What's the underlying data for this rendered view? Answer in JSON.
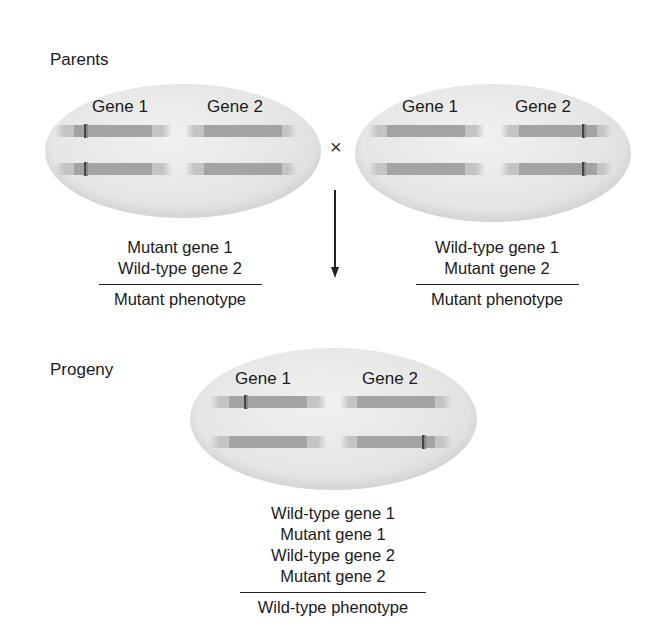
{
  "parents": {
    "section_label": "Parents",
    "cross_symbol": "×",
    "left": {
      "gene_labels": [
        "Gene 1",
        "Gene 2"
      ],
      "chromosomes": [
        {
          "gene1_mutant": true,
          "gene2_mutant": false
        },
        {
          "gene1_mutant": true,
          "gene2_mutant": false
        }
      ],
      "genotype": [
        "Mutant gene 1",
        "Wild-type gene 2"
      ],
      "phenotype": "Mutant phenotype"
    },
    "right": {
      "gene_labels": [
        "Gene 1",
        "Gene 2"
      ],
      "chromosomes": [
        {
          "gene1_mutant": false,
          "gene2_mutant": true
        },
        {
          "gene1_mutant": false,
          "gene2_mutant": true
        }
      ],
      "genotype": [
        "Wild-type gene 1",
        "Mutant gene 2"
      ],
      "phenotype": "Mutant phenotype"
    }
  },
  "progeny": {
    "section_label": "Progeny",
    "gene_labels": [
      "Gene 1",
      "Gene 2"
    ],
    "chromosomes": [
      {
        "gene1_mutant": true,
        "gene2_mutant": false
      },
      {
        "gene1_mutant": false,
        "gene2_mutant": true
      }
    ],
    "genotype": [
      "Wild-type gene 1",
      "Mutant gene 1",
      "Wild-type gene 2",
      "Mutant gene 2"
    ],
    "phenotype": "Wild-type phenotype"
  },
  "colors": {
    "cell_fill": "#e6e6e6",
    "chromosome": "#c4c4c4",
    "gene_region": "#a3a3a3",
    "mutation_mark": "#444444"
  }
}
